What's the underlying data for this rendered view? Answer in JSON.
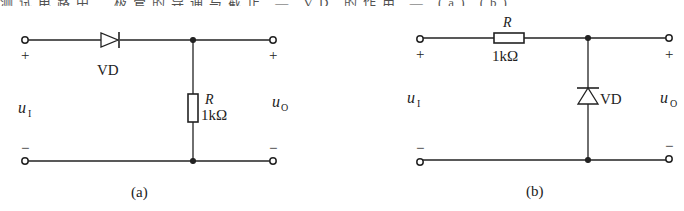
{
  "top_strip": {
    "text": "测试电路中二极管的导通与截止 — VD 的作用 — (a) (b)"
  },
  "circuit_a": {
    "caption": "(a)",
    "diode_label": "VD",
    "resistor_name": "R",
    "resistor_value": "1kΩ",
    "input_label": "u",
    "input_sub": "I",
    "output_label": "u",
    "output_sub": "O",
    "plus": "+",
    "minus": "−"
  },
  "circuit_b": {
    "caption": "(b)",
    "diode_label": "VD",
    "resistor_name": "R",
    "resistor_value": "1kΩ",
    "input_label": "u",
    "input_sub": "I",
    "output_label": "u",
    "output_sub": "O",
    "plus": "+",
    "minus": "−"
  },
  "colors": {
    "line": "#222222",
    "background": "#ffffff"
  }
}
